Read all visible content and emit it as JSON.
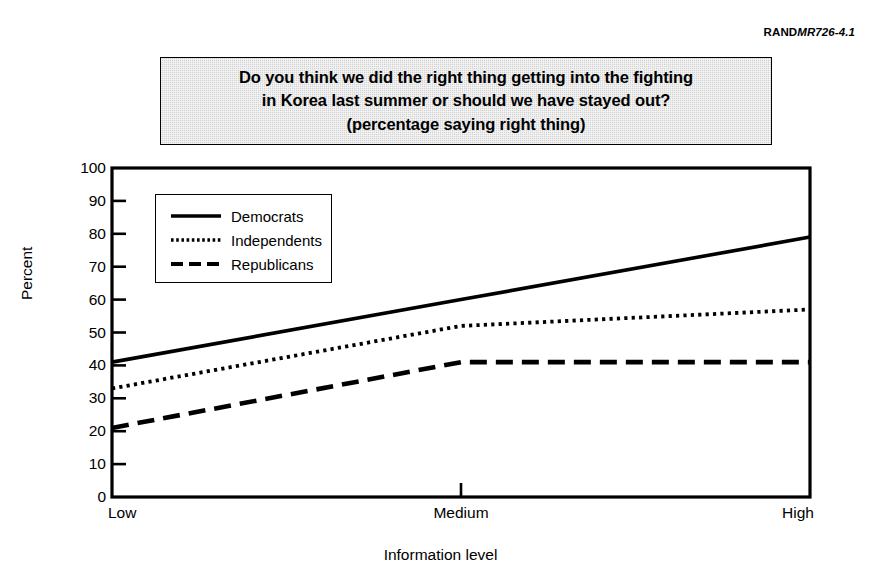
{
  "rand_code": {
    "prefix": "RAND",
    "suffix": "MR726-4.1"
  },
  "title": {
    "line1": "Do you think we did the right thing getting into the fighting",
    "line2": "in Korea last summer or should we have stayed out?",
    "line3": "(percentage saying right thing)"
  },
  "chart_data": {
    "type": "line",
    "title": "Do you think we did the right thing getting into the fighting in Korea last summer or should we have stayed out? (percentage saying right thing)",
    "xlabel": "Information level",
    "ylabel": "Percent",
    "categories": [
      "Low",
      "Medium",
      "High"
    ],
    "ylim": [
      0,
      100
    ],
    "yticks": [
      0,
      10,
      20,
      30,
      40,
      50,
      60,
      70,
      80,
      90,
      100
    ],
    "ytick_labels": [
      "0",
      "10",
      "20",
      "30",
      "40",
      "50",
      "60",
      "70",
      "80",
      "90",
      "100"
    ],
    "grid": false,
    "legend_position": "upper left",
    "series": [
      {
        "name": "Democrats",
        "style": "solid",
        "values": [
          41,
          60,
          79
        ]
      },
      {
        "name": "Independents",
        "style": "dotted",
        "values": [
          33,
          52,
          57
        ]
      },
      {
        "name": "Republicans",
        "style": "dashed",
        "values": [
          21,
          41,
          41
        ]
      }
    ]
  },
  "legend": {
    "items": [
      {
        "label": "Democrats",
        "style": "solid"
      },
      {
        "label": "Independents",
        "style": "dotted"
      },
      {
        "label": "Republicans",
        "style": "dashed"
      }
    ]
  }
}
